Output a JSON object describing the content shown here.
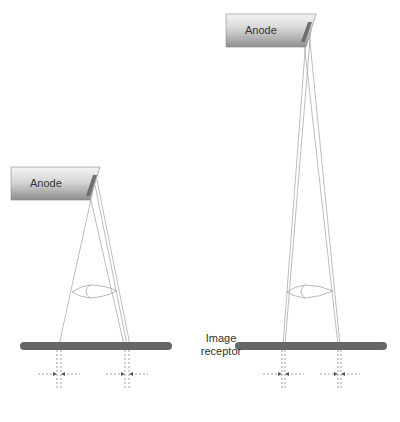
{
  "left_setup": {
    "anode_label": "Anode"
  },
  "right_setup": {
    "anode_label": "Anode"
  },
  "receptor_label_line1": "Image",
  "receptor_label_line2": "receptor",
  "colors": {
    "receptor": "#666666",
    "anode_dark": "#8a8a8a",
    "anode_light": "#e8e8e8",
    "target": "#777777",
    "rays": "#9a9a9a"
  }
}
